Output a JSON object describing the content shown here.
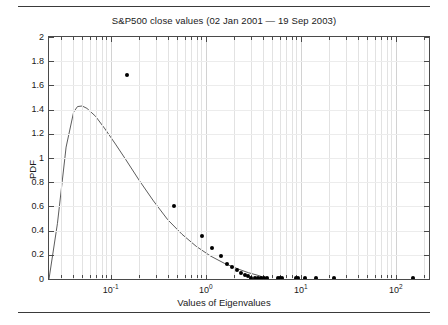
{
  "chart_data": {
    "type": "scatter",
    "title": "S&P500 close values (02 Jan 2001 — 19 Sep 2003)",
    "xlabel": "Values of Eigenvalues",
    "ylabel": "PDF",
    "xscale": "log",
    "yscale": "linear",
    "xlim": [
      0.0224,
      224.0
    ],
    "ylim": [
      0,
      2
    ],
    "grid": true,
    "legend": null,
    "xticks": [
      {
        "value": 0.1,
        "label": "10",
        "exponent": "-1"
      },
      {
        "value": 1,
        "label": "10",
        "exponent": "0"
      },
      {
        "value": 10,
        "label": "10",
        "exponent": "1"
      },
      {
        "value": 100,
        "label": "10",
        "exponent": "2"
      }
    ],
    "yticks": [
      "0",
      "0.2",
      "0.4",
      "0.6",
      "0.8",
      "1",
      "1.2",
      "1.4",
      "1.6",
      "1.8",
      "2"
    ],
    "ytick_values": [
      0,
      0.2,
      0.4,
      0.6,
      0.8,
      1,
      1.2,
      1.4,
      1.6,
      1.8,
      2
    ],
    "series": [
      {
        "name": "Empirical PDF of eigenvalues",
        "type": "scatter",
        "marker": "filled-circle",
        "color": "#000000",
        "points": [
          {
            "x": 0.148,
            "y": 1.685
          },
          {
            "x": 0.468,
            "y": 0.6
          },
          {
            "x": 0.912,
            "y": 0.355
          },
          {
            "x": 1.175,
            "y": 0.256
          },
          {
            "x": 1.445,
            "y": 0.19
          },
          {
            "x": 1.66,
            "y": 0.128
          },
          {
            "x": 1.905,
            "y": 0.103
          },
          {
            "x": 2.138,
            "y": 0.078
          },
          {
            "x": 2.344,
            "y": 0.053
          },
          {
            "x": 2.57,
            "y": 0.033
          },
          {
            "x": 2.818,
            "y": 0.021
          },
          {
            "x": 3.02,
            "y": 0.012
          },
          {
            "x": 3.311,
            "y": 0.008
          },
          {
            "x": 3.548,
            "y": 0.008
          },
          {
            "x": 3.802,
            "y": 0.008
          },
          {
            "x": 4.074,
            "y": 0.008
          },
          {
            "x": 4.365,
            "y": 0.008
          },
          {
            "x": 5.754,
            "y": 0.008
          },
          {
            "x": 6.026,
            "y": 0.008
          },
          {
            "x": 6.31,
            "y": 0.008
          },
          {
            "x": 8.913,
            "y": 0.008
          },
          {
            "x": 9.333,
            "y": 0.008
          },
          {
            "x": 11.22,
            "y": 0.008
          },
          {
            "x": 14.45,
            "y": 0.008
          },
          {
            "x": 22.39,
            "y": 0.008
          },
          {
            "x": 151.4,
            "y": 0.008
          }
        ]
      },
      {
        "name": "Marchenko-Pastur fit",
        "type": "line",
        "color": "#4a4a4a",
        "points": [
          {
            "x": 0.0224,
            "y": 0.0
          },
          {
            "x": 0.0275,
            "y": 0.46
          },
          {
            "x": 0.0339,
            "y": 1.09
          },
          {
            "x": 0.0407,
            "y": 1.38
          },
          {
            "x": 0.0447,
            "y": 1.425
          },
          {
            "x": 0.0501,
            "y": 1.43
          },
          {
            "x": 0.0562,
            "y": 1.41
          },
          {
            "x": 0.0692,
            "y": 1.345
          },
          {
            "x": 0.0871,
            "y": 1.24
          },
          {
            "x": 0.1122,
            "y": 1.115
          },
          {
            "x": 0.1445,
            "y": 0.985
          },
          {
            "x": 0.1995,
            "y": 0.815
          },
          {
            "x": 0.2818,
            "y": 0.645
          },
          {
            "x": 0.3981,
            "y": 0.49
          },
          {
            "x": 0.5623,
            "y": 0.37
          },
          {
            "x": 0.7943,
            "y": 0.27
          },
          {
            "x": 1.122,
            "y": 0.19
          },
          {
            "x": 1.585,
            "y": 0.128
          },
          {
            "x": 2.239,
            "y": 0.08
          },
          {
            "x": 2.818,
            "y": 0.052
          },
          {
            "x": 3.548,
            "y": 0.03
          },
          {
            "x": 4.074,
            "y": 0.014
          },
          {
            "x": 4.365,
            "y": 0.004
          },
          {
            "x": 4.571,
            "y": 0.0
          }
        ]
      }
    ]
  }
}
